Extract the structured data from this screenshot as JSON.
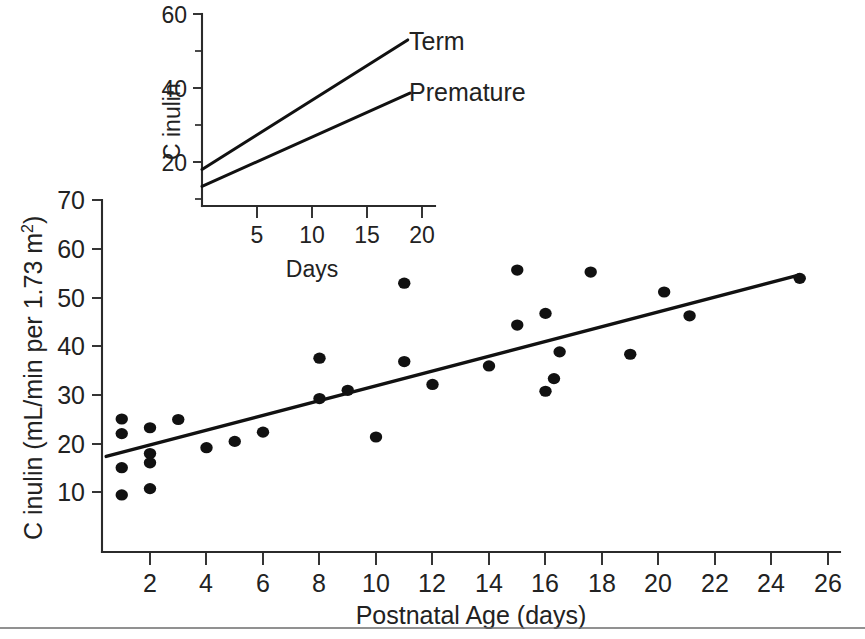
{
  "figure": {
    "background_color": "#ffffff",
    "ink_color": "#111111",
    "footer_rule_color": "#6d6d6d"
  },
  "chart_data": [
    {
      "id": "main-scatter",
      "type": "scatter",
      "title": "",
      "xlabel": "Postnatal Age (days)",
      "ylabel": "C inulin (mL/min per 1.73 m2)",
      "ylabel_base": "C inulin (mL/min per 1.73 m",
      "ylabel_superscript": "2",
      "ylabel_tail": ")",
      "xlim": [
        0,
        26.6
      ],
      "ylim": [
        0,
        72
      ],
      "grid": false,
      "legend": "none",
      "xticks": [
        2,
        4,
        6,
        8,
        10,
        12,
        14,
        16,
        18,
        20,
        22,
        24,
        26
      ],
      "xtick_labels": [
        "2",
        "4",
        "6",
        "8",
        "10",
        "12",
        "14",
        "16",
        "18",
        "20",
        "22",
        "24",
        "26"
      ],
      "yticks": [
        10,
        20,
        30,
        40,
        50,
        60,
        70
      ],
      "ytick_labels": [
        "10",
        "20",
        "30",
        "40",
        "50",
        "60",
        "70"
      ],
      "points": [
        {
          "x": 1.0,
          "y": 25.0
        },
        {
          "x": 1.0,
          "y": 22.0
        },
        {
          "x": 1.0,
          "y": 15.0
        },
        {
          "x": 1.0,
          "y": 9.4
        },
        {
          "x": 2.0,
          "y": 23.2
        },
        {
          "x": 2.0,
          "y": 17.9
        },
        {
          "x": 2.0,
          "y": 16.0
        },
        {
          "x": 2.0,
          "y": 10.7
        },
        {
          "x": 3.0,
          "y": 24.9
        },
        {
          "x": 4.0,
          "y": 19.1
        },
        {
          "x": 5.0,
          "y": 20.4
        },
        {
          "x": 6.0,
          "y": 22.3
        },
        {
          "x": 8.0,
          "y": 37.5
        },
        {
          "x": 8.0,
          "y": 29.2
        },
        {
          "x": 9.0,
          "y": 30.9
        },
        {
          "x": 10.0,
          "y": 21.3
        },
        {
          "x": 11.0,
          "y": 52.9
        },
        {
          "x": 11.0,
          "y": 36.8
        },
        {
          "x": 12.0,
          "y": 32.1
        },
        {
          "x": 14.0,
          "y": 35.9
        },
        {
          "x": 15.0,
          "y": 55.6
        },
        {
          "x": 15.0,
          "y": 44.3
        },
        {
          "x": 16.0,
          "y": 46.7
        },
        {
          "x": 16.0,
          "y": 30.7
        },
        {
          "x": 16.3,
          "y": 33.3
        },
        {
          "x": 16.5,
          "y": 38.8
        },
        {
          "x": 17.6,
          "y": 55.2
        },
        {
          "x": 19.0,
          "y": 38.3
        },
        {
          "x": 20.2,
          "y": 51.1
        },
        {
          "x": 21.1,
          "y": 46.2
        },
        {
          "x": 25.0,
          "y": 53.9
        }
      ],
      "fit_line": {
        "x1": 0.45,
        "y1": 17.3,
        "x2": 25.0,
        "y2": 54.6
      }
    },
    {
      "id": "inset-lines",
      "type": "line",
      "title": "",
      "xlabel": "Days",
      "ylabel": "C inulin",
      "xlim": [
        0,
        21.5
      ],
      "ylim": [
        2,
        62
      ],
      "grid": false,
      "legend": "inline-right",
      "xticks": [
        5,
        10,
        15,
        20
      ],
      "xtick_labels": [
        "5",
        "10",
        "15",
        "20"
      ],
      "yticks": [
        20,
        40,
        60
      ],
      "ytick_labels": [
        "20",
        "40",
        "60"
      ],
      "yticks_minor": [
        10,
        30,
        50
      ],
      "series": [
        {
          "name": "Term",
          "x": [
            0,
            18.7
          ],
          "values": [
            18.0,
            53.0
          ]
        },
        {
          "name": "Premature",
          "x": [
            0,
            18.9
          ],
          "values": [
            13.4,
            38.6
          ]
        }
      ]
    }
  ]
}
